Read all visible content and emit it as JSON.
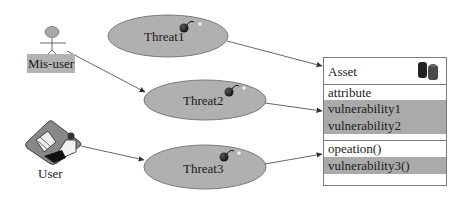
{
  "actors": {
    "misuser": {
      "label": "Mis-user",
      "icon": "stick-figure-icon"
    },
    "user": {
      "label": "User",
      "icon": "person-at-computer-icon"
    }
  },
  "threats": [
    {
      "label": "Threat1",
      "icon": "bomb-icon"
    },
    {
      "label": "Threat2",
      "icon": "bomb-icon"
    },
    {
      "label": "Threat3",
      "icon": "bomb-icon"
    }
  ],
  "asset": {
    "name": "Asset",
    "icon": "database-cylinders-icon",
    "attribute_header": "attribute",
    "attributes": [
      "vulnerability1",
      "vulnerability2"
    ],
    "operation_header": "opeation()",
    "operations": [
      "vulnerability3()"
    ]
  },
  "colors": {
    "ellipse_fill": "#b0b0b0",
    "vuln_fill": "#aaaaaa",
    "label_bg": "#b3b3b3",
    "line": "#555555"
  }
}
